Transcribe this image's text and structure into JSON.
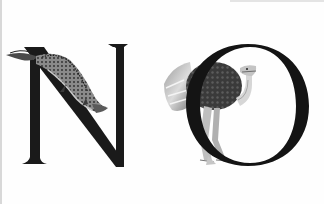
{
  "artwork": {
    "letters": [
      "N",
      "O"
    ],
    "word": "NO",
    "letter_color": "#1a1a1a",
    "background_color": "#fefefe",
    "illustrations": [
      {
        "name": "crocodile",
        "on_letter": "N"
      },
      {
        "name": "ostrich",
        "on_letter": "O"
      }
    ]
  }
}
